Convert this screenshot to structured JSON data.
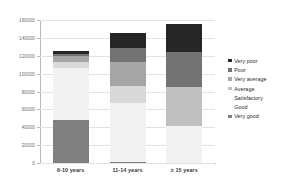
{
  "chart_data": {
    "type": "bar",
    "subtype": "stacked-bar",
    "title": "",
    "xlabel": "",
    "ylabel": "",
    "categories": [
      "6-10 years",
      "11-14 years",
      "≥ 15 years"
    ],
    "ylim": [
      0,
      160000
    ],
    "yticks": [
      0,
      20000,
      40000,
      60000,
      80000,
      100000,
      120000,
      140000,
      160000
    ],
    "ytick_labels": [
      "0",
      "20000",
      "40000",
      "60000",
      "80000",
      "100000",
      "120000",
      "140000",
      "160000"
    ],
    "grid": true,
    "legend_position": "right",
    "series": [
      {
        "name": "Very good",
        "color": "#808080",
        "values": [
          48000,
          1500,
          0
        ]
      },
      {
        "name": "Good",
        "color": "#f2f2f2",
        "values": [
          58000,
          65500,
          41000
        ]
      },
      {
        "name": "Satisfactory",
        "color": "#d9d9d9",
        "values": [
          7000,
          19000,
          0
        ]
      },
      {
        "name": "Average",
        "color": "#c0c0c0",
        "values": [
          0,
          0,
          44000
        ]
      },
      {
        "name": "Very average",
        "color": "#a6a6a6",
        "values": [
          7000,
          26500,
          0
        ]
      },
      {
        "name": "Poor",
        "color": "#737373",
        "values": [
          2000,
          16500,
          39000
        ]
      },
      {
        "name": "Very poor",
        "color": "#262626",
        "values": [
          3000,
          16000,
          31000
        ]
      }
    ],
    "totals": [
      125000,
      145000,
      155000
    ]
  },
  "legend": {
    "items": [
      {
        "label": "Very poor",
        "color": "#262626",
        "swatch": true
      },
      {
        "label": "Poor",
        "color": "#737373",
        "swatch": true
      },
      {
        "label": "Very average",
        "color": "#a6a6a6",
        "swatch": true
      },
      {
        "label": "Average",
        "color": "#c0c0c0",
        "swatch": true
      },
      {
        "label": "Satisfactory",
        "color": "#d9d9d9",
        "swatch": false
      },
      {
        "label": "Good",
        "color": "#f2f2f2",
        "swatch": false
      },
      {
        "label": "Very good",
        "color": "#808080",
        "swatch": true
      }
    ]
  }
}
